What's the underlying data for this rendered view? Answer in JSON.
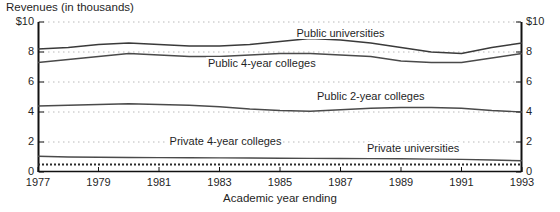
{
  "chart_data": {
    "type": "line",
    "title": "Revenues (in thousands)",
    "xlabel": "Academic year ending",
    "ylabel": "",
    "grid": "horizontal-dotted",
    "legend_position": "inline-annotations",
    "xlim": [
      1977,
      1993
    ],
    "ylim": [
      0,
      10
    ],
    "yticks": [
      0,
      2,
      4,
      6,
      8,
      10
    ],
    "ytick_labels_left": [
      "$10",
      "8",
      "6",
      "4",
      "2",
      "0"
    ],
    "ytick_labels_right": [
      "$10",
      "8",
      "6",
      "4",
      "2",
      "0"
    ],
    "xticks": [
      1977,
      1979,
      1981,
      1983,
      1985,
      1987,
      1989,
      1991,
      1993
    ],
    "xtick_labels": [
      "1977",
      "1979",
      "1981",
      "1983",
      "1985",
      "1987",
      "1989",
      "1991",
      "1993"
    ],
    "x": [
      1977,
      1978,
      1979,
      1980,
      1981,
      1982,
      1983,
      1984,
      1985,
      1986,
      1987,
      1988,
      1989,
      1990,
      1991,
      1992,
      1993
    ],
    "series": [
      {
        "name": "Public universities",
        "style": "solid",
        "color": "#3a3a3a",
        "values": [
          8.2,
          8.3,
          8.5,
          8.6,
          8.5,
          8.4,
          8.4,
          8.5,
          8.7,
          8.9,
          8.8,
          8.6,
          8.3,
          8.0,
          7.9,
          8.3,
          8.6
        ]
      },
      {
        "name": "Public 4-year colleges",
        "style": "solid",
        "color": "#4a4a4a",
        "values": [
          7.3,
          7.5,
          7.7,
          7.9,
          7.8,
          7.7,
          7.7,
          7.8,
          7.9,
          7.9,
          7.8,
          7.7,
          7.4,
          7.3,
          7.3,
          7.6,
          7.9
        ]
      },
      {
        "name": "Public 2-year colleges",
        "style": "solid",
        "color": "#4a4a4a",
        "values": [
          4.4,
          4.45,
          4.5,
          4.55,
          4.5,
          4.45,
          4.35,
          4.2,
          4.1,
          4.05,
          4.15,
          4.25,
          4.3,
          4.3,
          4.25,
          4.1,
          4.0
        ]
      },
      {
        "name": "Private 4-year colleges",
        "style": "solid",
        "color": "#4a4a4a",
        "values": [
          1.05,
          1.0,
          0.98,
          0.97,
          0.96,
          0.95,
          0.94,
          0.93,
          0.92,
          0.91,
          0.9,
          0.89,
          0.88,
          0.86,
          0.84,
          0.8,
          0.75
        ]
      },
      {
        "name": "Private universities",
        "style": "dotted",
        "color": "#2a2a2a",
        "values": [
          0.5,
          0.5,
          0.5,
          0.5,
          0.5,
          0.5,
          0.5,
          0.5,
          0.5,
          0.5,
          0.5,
          0.5,
          0.5,
          0.5,
          0.5,
          0.5,
          0.5
        ]
      }
    ],
    "annotations": [
      {
        "text": "Public universities",
        "x": 1987.0,
        "y": 9.25
      },
      {
        "text": "Public 4-year colleges",
        "x": 1984.4,
        "y": 7.25
      },
      {
        "text": "Public 2-year colleges",
        "x": 1988.0,
        "y": 5.05
      },
      {
        "text": "Private 4-year colleges",
        "x": 1983.2,
        "y": 2.05
      },
      {
        "text": "Private universities",
        "x": 1989.4,
        "y": 1.62
      }
    ]
  }
}
